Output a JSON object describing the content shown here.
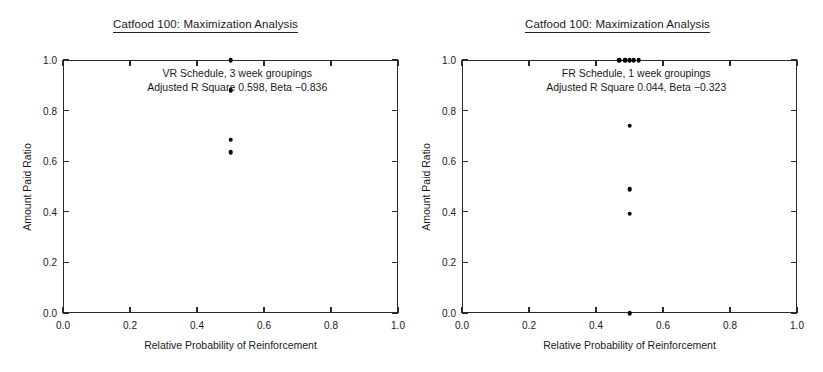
{
  "figure": {
    "width": 823,
    "height": 372,
    "background": "#ffffff",
    "point_color": "#000000",
    "axis_color": "#2a2a2a"
  },
  "panels": [
    {
      "id": "left",
      "title": "Catfood 100: Maximization Analysis",
      "annotation_line1": "VR Schedule, 3 week groupings",
      "annotation_line2": "Adjusted R Square 0.598, Beta −0.836",
      "chart_data": {
        "type": "scatter",
        "title": "Catfood 100: Maximization Analysis",
        "xlabel": "Relative Probability of Reinforcement",
        "ylabel": "Amount Paid Ratio",
        "xlim": [
          0.0,
          1.0
        ],
        "ylim": [
          0.0,
          1.0
        ],
        "xticks": [
          0.0,
          0.2,
          0.4,
          0.6,
          0.8,
          1.0
        ],
        "yticks": [
          0.0,
          0.2,
          0.4,
          0.6,
          0.8,
          1.0
        ],
        "xticklabels": [
          "0.0",
          "0.2",
          "0.4",
          "0.6",
          "0.8",
          "1.0"
        ],
        "yticklabels": [
          "0.0",
          "0.2",
          "0.4",
          "0.6",
          "0.8",
          "1.0"
        ],
        "grid": false,
        "legend": false,
        "annotations": [
          "VR Schedule, 3 week groupings",
          "Adjusted R Square 0.598, Beta −0.836"
        ],
        "stats": {
          "schedule": "VR",
          "grouping": "3 week groupings",
          "adjusted_r_square": 0.598,
          "beta": -0.836
        },
        "points": [
          {
            "x": 0.5,
            "y": 1.0
          },
          {
            "x": 0.5,
            "y": 0.88
          },
          {
            "x": 0.5,
            "y": 0.685
          },
          {
            "x": 0.5,
            "y": 0.635
          }
        ]
      }
    },
    {
      "id": "right",
      "title": "Catfood 100: Maximization Analysis",
      "annotation_line1": "FR Schedule, 1 week groupings",
      "annotation_line2": "Adjusted R Square 0.044, Beta −0.323",
      "chart_data": {
        "type": "scatter",
        "title": "Catfood 100: Maximization Analysis",
        "xlabel": "Relative Probability of Reinforcement",
        "ylabel": "Amount Paid Ratio",
        "xlim": [
          0.0,
          1.0
        ],
        "ylim": [
          0.0,
          1.0
        ],
        "xticks": [
          0.0,
          0.2,
          0.4,
          0.6,
          0.8,
          1.0
        ],
        "yticks": [
          0.0,
          0.2,
          0.4,
          0.6,
          0.8,
          1.0
        ],
        "xticklabels": [
          "0.0",
          "0.2",
          "0.4",
          "0.6",
          "0.8",
          "1.0"
        ],
        "yticklabels": [
          "0.0",
          "0.2",
          "0.4",
          "0.6",
          "0.8",
          "1.0"
        ],
        "grid": false,
        "legend": false,
        "annotations": [
          "FR Schedule, 1 week groupings",
          "Adjusted R Square 0.044, Beta −0.323"
        ],
        "stats": {
          "schedule": "FR",
          "grouping": "1 week groupings",
          "adjusted_r_square": 0.044,
          "beta": -0.323
        },
        "points": [
          {
            "x": 0.47,
            "y": 1.0
          },
          {
            "x": 0.487,
            "y": 1.0
          },
          {
            "x": 0.5,
            "y": 1.0
          },
          {
            "x": 0.513,
            "y": 1.0
          },
          {
            "x": 0.528,
            "y": 1.0
          },
          {
            "x": 0.5,
            "y": 0.74
          },
          {
            "x": 0.5,
            "y": 0.49
          },
          {
            "x": 0.5,
            "y": 0.392
          },
          {
            "x": 0.5,
            "y": 0.0
          }
        ]
      }
    }
  ]
}
